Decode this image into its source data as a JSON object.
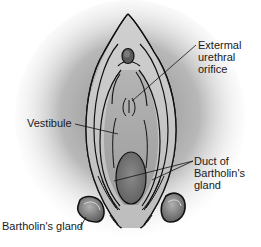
{
  "figure": {
    "type": "anatomical-illustration",
    "colors": {
      "background": "#ffffff",
      "halo": "#9a9a9a",
      "tissue_light": "#c8c8c8",
      "tissue_mid": "#a6a6a6",
      "tissue_dark": "#6e6e6e",
      "outline": "#111111"
    }
  },
  "labels": {
    "urethral_orifice": {
      "lines": [
        "Extermal",
        "urethral",
        "orifice"
      ]
    },
    "vestibule": {
      "lines": [
        "Vestibule"
      ]
    },
    "duct": {
      "lines": [
        "Duct of",
        "Bartholin's",
        "gland"
      ]
    },
    "bartholin_gland": {
      "lines": [
        "Bartholin's gland"
      ]
    }
  }
}
